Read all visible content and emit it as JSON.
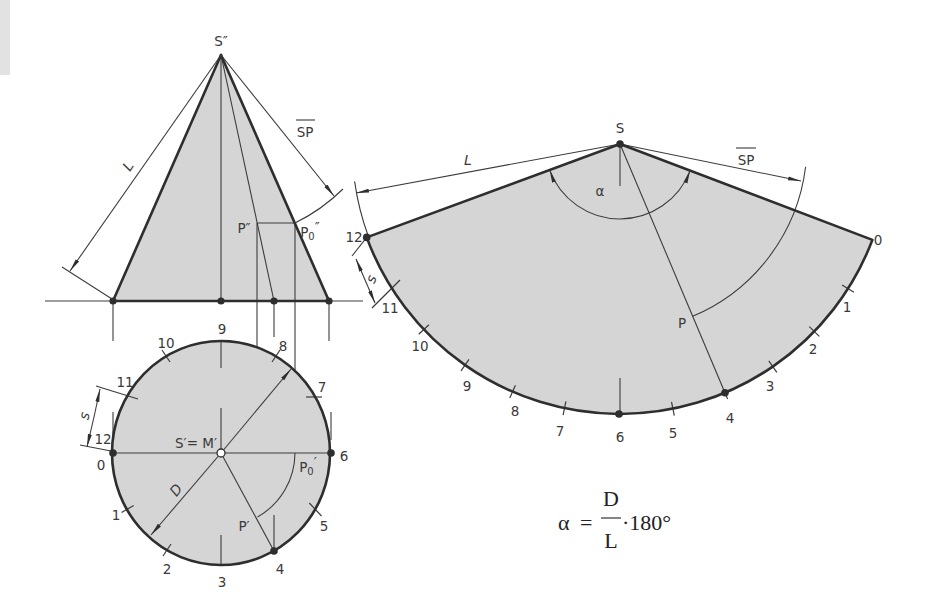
{
  "colors": {
    "fill": "#d5d5d5",
    "line": "#2e2e2e",
    "margin_patch": "#e2e2e2"
  },
  "front_view": {
    "apex": "S″",
    "slant_length": "L",
    "segment": "SP",
    "point_p": "P″",
    "point_p0": {
      "main": "P",
      "sub": "0",
      "prime": "″"
    }
  },
  "top_view": {
    "center": "S′= M′",
    "diameter": "D",
    "arc_length": "s",
    "point_p": "P′",
    "point_p0": {
      "main": "P",
      "sub": "0",
      "prime": "′"
    },
    "divisions": [
      "0",
      "1",
      "2",
      "3",
      "4",
      "5",
      "6",
      "7",
      "8",
      "9",
      "10",
      "11",
      "12"
    ]
  },
  "development": {
    "apex": "S",
    "slant_length": "L",
    "segment": "SP",
    "angle": "α",
    "point_p": "P",
    "arc_length": "s",
    "divisions": [
      "0",
      "1",
      "2",
      "3",
      "4",
      "5",
      "6",
      "7",
      "8",
      "9",
      "10",
      "11",
      "12"
    ]
  },
  "formula": {
    "lhs": "α",
    "eq": "=",
    "numerator": "D",
    "denominator": "L",
    "rest": "·180°"
  }
}
